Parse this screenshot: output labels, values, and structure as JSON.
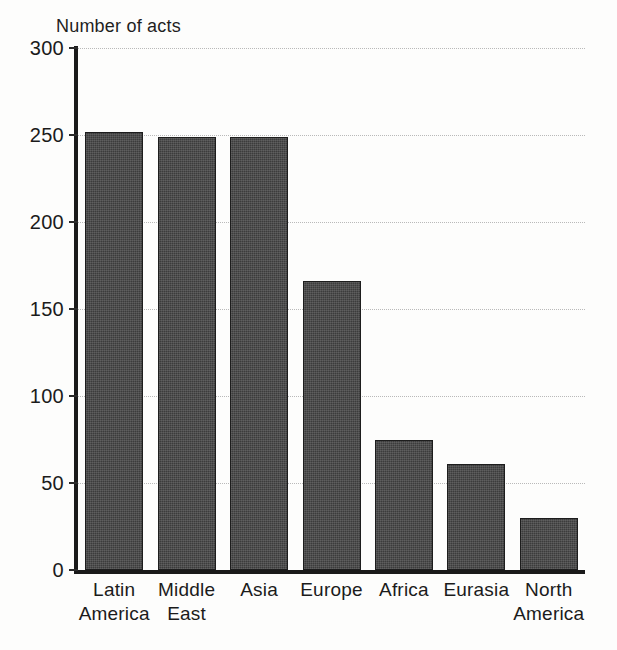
{
  "chart_data": {
    "type": "bar",
    "title": "",
    "partial_title_above": "",
    "ylabel": "Number of acts",
    "xlabel": "",
    "categories": [
      "Latin America",
      "Middle East",
      "Asia",
      "Europe",
      "Africa",
      "Eurasia",
      "North America"
    ],
    "category_lines": [
      [
        "Latin",
        "America"
      ],
      [
        "Middle",
        "East"
      ],
      [
        "Asia",
        ""
      ],
      [
        "Europe",
        ""
      ],
      [
        "Africa",
        ""
      ],
      [
        "Eurasia",
        ""
      ],
      [
        "North",
        "America"
      ]
    ],
    "values": [
      252,
      249,
      249,
      166,
      75,
      61,
      30
    ],
    "ylim": [
      0,
      300
    ],
    "yticks": [
      0,
      50,
      100,
      150,
      200,
      250,
      300
    ],
    "ytick_labels": [
      "0",
      "50",
      "100",
      "150",
      "200",
      "250",
      "300"
    ],
    "grid": true,
    "grid_style": "dotted horizontal",
    "legend": "none",
    "bar_color": "#3c3c3c",
    "bar_border_color": "#1d1d1d",
    "axis_color": "#1a1a1a",
    "gridline_color": "#b9b9b9",
    "background_color": "#fdfdfc"
  }
}
